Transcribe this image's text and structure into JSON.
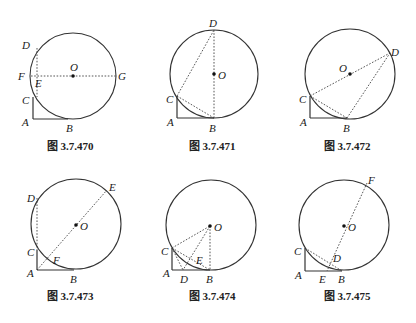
{
  "figures": [
    {
      "caption": "图 3.7.470",
      "circle": {
        "cx": 73,
        "cy": 76,
        "r": 43
      },
      "points": {
        "A": [
          33,
          119
        ],
        "B": [
          68,
          119
        ],
        "C": [
          33,
          97
        ],
        "D": [
          37,
          48
        ],
        "E": [
          37,
          76
        ],
        "F": [
          30,
          76
        ],
        "G": [
          116,
          76
        ],
        "O": [
          73,
          76
        ]
      },
      "labels": [
        {
          "t": "D",
          "x": 22,
          "y": 49
        },
        {
          "t": "F",
          "x": 18,
          "y": 80
        },
        {
          "t": "E",
          "x": 35,
          "y": 87
        },
        {
          "t": "O",
          "x": 70,
          "y": 71
        },
        {
          "t": "G",
          "x": 118,
          "y": 80
        },
        {
          "t": "C",
          "x": 22,
          "y": 104
        },
        {
          "t": "A",
          "x": 22,
          "y": 126
        },
        {
          "t": "B",
          "x": 66,
          "y": 132
        }
      ],
      "solid": [
        [
          [
            33,
            97
          ],
          [
            33,
            119
          ]
        ],
        [
          [
            33,
            119
          ],
          [
            68,
            119
          ]
        ]
      ],
      "dotted": [
        [
          [
            37,
            48
          ],
          [
            37,
            97
          ]
        ],
        [
          [
            31,
            76
          ],
          [
            116,
            76
          ]
        ]
      ],
      "caption_pos": [
        70,
        150
      ]
    },
    {
      "caption": "图 3.7.471",
      "circle": {
        "cx": 214,
        "cy": 74,
        "r": 44
      },
      "points": {
        "A": [
          177,
          118
        ],
        "B": [
          214,
          118
        ],
        "C": [
          177,
          96
        ],
        "D": [
          214,
          30
        ],
        "O": [
          214,
          74
        ]
      },
      "labels": [
        {
          "t": "D",
          "x": 209,
          "y": 27
        },
        {
          "t": "O",
          "x": 218,
          "y": 79
        },
        {
          "t": "C",
          "x": 166,
          "y": 103
        },
        {
          "t": "A",
          "x": 167,
          "y": 126
        },
        {
          "t": "B",
          "x": 209,
          "y": 132
        }
      ],
      "solid": [
        [
          [
            177,
            96
          ],
          [
            177,
            118
          ]
        ],
        [
          [
            177,
            118
          ],
          [
            214,
            118
          ]
        ]
      ],
      "dotted": [
        [
          [
            214,
            30
          ],
          [
            214,
            118
          ]
        ],
        [
          [
            177,
            96
          ],
          [
            214,
            30
          ]
        ],
        [
          [
            177,
            96
          ],
          [
            214,
            118
          ]
        ]
      ],
      "caption_pos": [
        212,
        150
      ]
    },
    {
      "caption": "图 3.7.472",
      "circle": {
        "cx": 350,
        "cy": 74,
        "r": 45
      },
      "points": {
        "A": [
          310,
          118
        ],
        "B": [
          347,
          118
        ],
        "C": [
          310,
          96
        ],
        "D": [
          390,
          53
        ],
        "O": [
          350,
          74
        ]
      },
      "labels": [
        {
          "t": "D",
          "x": 391,
          "y": 56
        },
        {
          "t": "O",
          "x": 339,
          "y": 72
        },
        {
          "t": "C",
          "x": 299,
          "y": 103
        },
        {
          "t": "A",
          "x": 300,
          "y": 126
        },
        {
          "t": "B",
          "x": 343,
          "y": 132
        }
      ],
      "solid": [
        [
          [
            310,
            96
          ],
          [
            310,
            118
          ]
        ],
        [
          [
            310,
            118
          ],
          [
            347,
            118
          ]
        ]
      ],
      "dotted": [
        [
          [
            310,
            96
          ],
          [
            390,
            53
          ]
        ],
        [
          [
            310,
            96
          ],
          [
            347,
            118
          ]
        ],
        [
          [
            347,
            118
          ],
          [
            390,
            53
          ]
        ]
      ],
      "caption_pos": [
        347,
        150
      ]
    },
    {
      "caption": "图 3.7.473",
      "circle": {
        "cx": 76,
        "cy": 224,
        "r": 45
      },
      "points": {
        "A": [
          37,
          270
        ],
        "B": [
          74,
          270
        ],
        "C": [
          37,
          250
        ],
        "D": [
          37,
          198
        ],
        "E": [
          107,
          190
        ],
        "F": [
          52,
          256
        ],
        "O": [
          76,
          225
        ]
      },
      "labels": [
        {
          "t": "D",
          "x": 27,
          "y": 202
        },
        {
          "t": "E",
          "x": 109,
          "y": 191
        },
        {
          "t": "O",
          "x": 80,
          "y": 230
        },
        {
          "t": "C",
          "x": 27,
          "y": 256
        },
        {
          "t": "F",
          "x": 53,
          "y": 264
        },
        {
          "t": "A",
          "x": 27,
          "y": 277
        },
        {
          "t": "B",
          "x": 70,
          "y": 283
        }
      ],
      "solid": [
        [
          [
            37,
            250
          ],
          [
            37,
            270
          ]
        ],
        [
          [
            37,
            270
          ],
          [
            74,
            270
          ]
        ]
      ],
      "dotted": [
        [
          [
            37,
            198
          ],
          [
            37,
            250
          ]
        ],
        [
          [
            37,
            270
          ],
          [
            107,
            190
          ]
        ]
      ],
      "caption_pos": [
        70,
        300
      ]
    },
    {
      "caption": "图 3.7.474",
      "circle": {
        "cx": 211,
        "cy": 225,
        "r": 45
      },
      "points": {
        "A": [
          172,
          270
        ],
        "B": [
          210,
          270
        ],
        "C": [
          172,
          248
        ],
        "D": [
          183,
          270
        ],
        "E": [
          197,
          256
        ],
        "O": [
          210,
          226
        ]
      },
      "labels": [
        {
          "t": "O",
          "x": 214,
          "y": 231
        },
        {
          "t": "C",
          "x": 161,
          "y": 255
        },
        {
          "t": "E",
          "x": 196,
          "y": 264
        },
        {
          "t": "A",
          "x": 163,
          "y": 277
        },
        {
          "t": "D",
          "x": 180,
          "y": 283
        },
        {
          "t": "B",
          "x": 206,
          "y": 283
        }
      ],
      "solid": [
        [
          [
            172,
            248
          ],
          [
            172,
            270
          ]
        ],
        [
          [
            172,
            270
          ],
          [
            210,
            270
          ]
        ]
      ],
      "dotted": [
        [
          [
            172,
            248
          ],
          [
            210,
            226
          ]
        ],
        [
          [
            172,
            248
          ],
          [
            210,
            270
          ]
        ],
        [
          [
            210,
            226
          ],
          [
            210,
            270
          ]
        ],
        [
          [
            210,
            226
          ],
          [
            183,
            270
          ]
        ],
        [
          [
            172,
            248
          ],
          [
            183,
            270
          ]
        ]
      ],
      "caption_pos": [
        212,
        300
      ]
    },
    {
      "caption": "图 3.7.475",
      "circle": {
        "cx": 344,
        "cy": 225,
        "r": 45
      },
      "points": {
        "A": [
          305,
          271
        ],
        "B": [
          342,
          271
        ],
        "C": [
          305,
          248
        ],
        "D": [
          332,
          264
        ],
        "E": [
          327,
          271
        ],
        "F": [
          367,
          183
        ],
        "O": [
          344,
          226
        ]
      },
      "labels": [
        {
          "t": "F",
          "x": 368,
          "y": 184
        },
        {
          "t": "O",
          "x": 348,
          "y": 231
        },
        {
          "t": "C",
          "x": 294,
          "y": 255
        },
        {
          "t": "D",
          "x": 333,
          "y": 262
        },
        {
          "t": "A",
          "x": 295,
          "y": 279
        },
        {
          "t": "E",
          "x": 319,
          "y": 283
        },
        {
          "t": "B",
          "x": 338,
          "y": 283
        }
      ],
      "solid": [
        [
          [
            305,
            248
          ],
          [
            305,
            271
          ]
        ],
        [
          [
            305,
            271
          ],
          [
            342,
            271
          ]
        ]
      ],
      "dotted": [
        [
          [
            305,
            248
          ],
          [
            342,
            271
          ]
        ],
        [
          [
            367,
            183
          ],
          [
            327,
            271
          ]
        ]
      ],
      "caption_pos": [
        347,
        300
      ]
    }
  ]
}
